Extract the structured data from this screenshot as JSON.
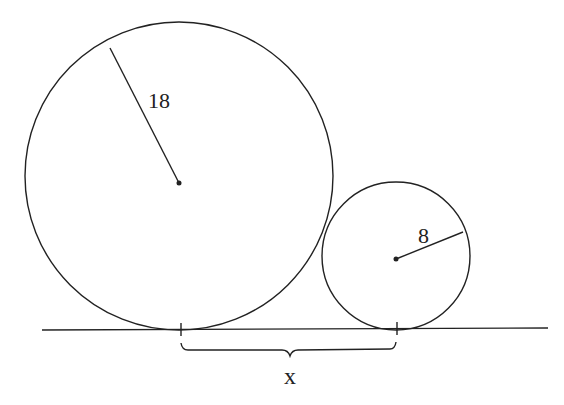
{
  "diagram": {
    "type": "geometry",
    "large_circle": {
      "radius_label": "18",
      "cx": 179,
      "cy": 183,
      "r": 156,
      "radius_end": [
        110,
        48
      ]
    },
    "small_circle": {
      "radius_label": "8",
      "cx": 395,
      "cy": 260,
      "r": 74,
      "radius_end": [
        463,
        232
      ]
    },
    "baseline": {
      "x1": 42,
      "x2": 548,
      "y": 329
    },
    "tangent_ticks": [
      181,
      396
    ],
    "brace": {
      "x1": 181,
      "x2": 396,
      "label": "x"
    },
    "colors": {
      "stroke": "#222222",
      "background": "#ffffff"
    }
  }
}
